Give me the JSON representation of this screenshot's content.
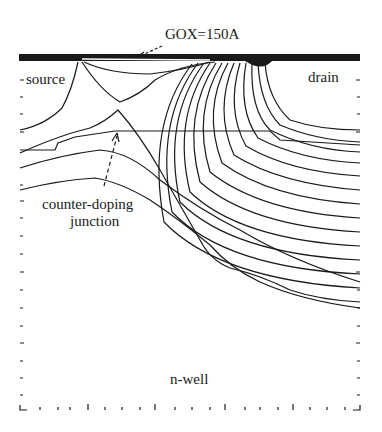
{
  "diagram": {
    "type": "device cross-section potential contour plot",
    "labels": {
      "gox": "GOX=150A",
      "source": "source",
      "drain": "drain",
      "counter_doping_line1": "counter-doping",
      "counter_doping_line2": "junction",
      "nwell": "n-well"
    },
    "colors": {
      "line": "#1a1a1a",
      "background": "#ffffff"
    }
  }
}
